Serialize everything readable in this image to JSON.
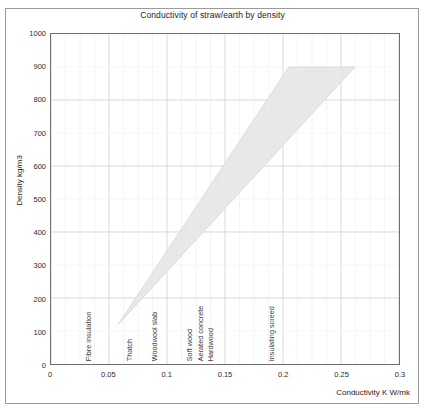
{
  "chart_data": {
    "type": "area",
    "title": "Conductivity of straw/earth by density",
    "xlabel": "Conductivity K W/mk",
    "ylabel": "Density kg/m3",
    "xlim": [
      0,
      0.3
    ],
    "ylim": [
      0,
      1000
    ],
    "grid": true,
    "legend": false,
    "xticks": [
      "0",
      "0.05",
      "0.1",
      "0.15",
      "0.2",
      "0.25",
      "0.3"
    ],
    "xtick_values": [
      0,
      0.05,
      0.1,
      0.15,
      0.2,
      0.25,
      0.3
    ],
    "yticks": [
      "0",
      "100",
      "200",
      "300",
      "400",
      "500",
      "600",
      "700",
      "800",
      "900",
      "1000"
    ],
    "ytick_values": [
      0,
      100,
      200,
      300,
      400,
      500,
      600,
      700,
      800,
      900,
      1000
    ],
    "band_fill_color": "#ececec",
    "band_edge_color": "#d4d4d4",
    "series": [
      {
        "name": "Lower bound (conductivity at given density)",
        "x": [
          0.058,
          0.09,
          0.12,
          0.15,
          0.18,
          0.205
        ],
        "y": [
          120,
          300,
          450,
          600,
          760,
          900
        ]
      },
      {
        "name": "Upper bound (conductivity at given density)",
        "x": [
          0.058,
          0.11,
          0.155,
          0.2,
          0.235,
          0.262
        ],
        "y": [
          120,
          300,
          450,
          600,
          760,
          900
        ]
      }
    ],
    "band_polygon": [
      {
        "x": 0.058,
        "y": 120
      },
      {
        "x": 0.205,
        "y": 900
      },
      {
        "x": 0.262,
        "y": 900
      },
      {
        "x": 0.058,
        "y": 120
      }
    ],
    "annotations": [
      {
        "label": "Fibre insulation",
        "x": 0.035
      },
      {
        "label": "Thatch",
        "x": 0.07
      },
      {
        "label": "Woodwool slab",
        "x": 0.092
      },
      {
        "label": "Soft wood",
        "x": 0.122
      },
      {
        "label": "Aerated concrete",
        "x": 0.131
      },
      {
        "label": "Hardwood",
        "x": 0.14
      },
      {
        "label": "Insulating screed",
        "x": 0.192
      }
    ]
  }
}
